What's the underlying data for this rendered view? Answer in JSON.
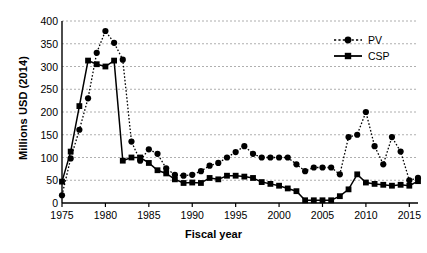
{
  "chart_data": {
    "type": "line",
    "title": "",
    "xlabel": "Fiscal year",
    "ylabel": "Millions USD (2014)",
    "xlim": [
      1975,
      2016
    ],
    "ylim": [
      0,
      400
    ],
    "xticks": [
      1975,
      1980,
      1985,
      1990,
      1995,
      2000,
      2005,
      2010,
      2015
    ],
    "yticks": [
      0,
      50,
      100,
      150,
      200,
      250,
      300,
      350,
      400
    ],
    "grid": true,
    "legend_position": "top-right",
    "x": [
      1975,
      1976,
      1977,
      1978,
      1979,
      1980,
      1981,
      1982,
      1983,
      1984,
      1985,
      1986,
      1987,
      1988,
      1989,
      1990,
      1991,
      1992,
      1993,
      1994,
      1995,
      1996,
      1997,
      1998,
      1999,
      2000,
      2001,
      2002,
      2003,
      2004,
      2005,
      2006,
      2007,
      2008,
      2009,
      2010,
      2011,
      2012,
      2013,
      2014,
      2015,
      2016
    ],
    "series": [
      {
        "name": "PV",
        "marker": "circle",
        "line": "dotted",
        "color": "#000000",
        "values": [
          17,
          98,
          161,
          230,
          330,
          378,
          352,
          315,
          135,
          93,
          118,
          108,
          76,
          62,
          60,
          62,
          70,
          82,
          88,
          100,
          112,
          125,
          108,
          100,
          100,
          100,
          100,
          85,
          70,
          78,
          78,
          78,
          63,
          145,
          150,
          200,
          125,
          85,
          145,
          113,
          50,
          55
        ]
      },
      {
        "name": "CSP",
        "marker": "square",
        "line": "solid",
        "color": "#000000",
        "values": [
          47,
          113,
          213,
          313,
          305,
          300,
          313,
          93,
          100,
          100,
          88,
          72,
          65,
          52,
          44,
          45,
          44,
          55,
          52,
          60,
          60,
          58,
          55,
          46,
          42,
          38,
          32,
          26,
          6,
          6,
          6,
          6,
          15,
          30,
          63,
          45,
          42,
          40,
          38,
          40,
          38,
          48
        ]
      }
    ]
  },
  "legend": {
    "items": [
      {
        "label": "PV"
      },
      {
        "label": "CSP"
      }
    ]
  }
}
